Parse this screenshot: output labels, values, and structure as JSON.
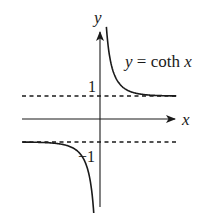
{
  "figure": {
    "title": "y = coth x",
    "curve_label": {
      "lhs": "y",
      "eq": " = coth ",
      "rhs": "x"
    },
    "axes": {
      "x_label": "x",
      "y_label": "y"
    },
    "ticks": {
      "y_pos_one": "1",
      "y_neg_one": "−1"
    },
    "asymptotes": [
      {
        "name": "y = 1",
        "style": "dashed"
      },
      {
        "name": "y = -1",
        "style": "dashed"
      }
    ],
    "colors": {
      "ink": "#1a1a1a",
      "background": "#ffffff"
    }
  },
  "chart_data": {
    "type": "line",
    "title": "y = coth x",
    "xlabel": "x",
    "ylabel": "y",
    "function": "coth(x)",
    "series": [
      {
        "name": "coth x (x>0)",
        "x": [
          0.28,
          0.4,
          0.6,
          0.8,
          1.0,
          1.5,
          2.0,
          2.5,
          3.0
        ],
        "values": [
          3.66,
          2.63,
          1.86,
          1.51,
          1.31,
          1.1,
          1.04,
          1.01,
          1.0
        ]
      },
      {
        "name": "coth x (x<0)",
        "x": [
          -3.1,
          -2.5,
          -2.0,
          -1.5,
          -1.0,
          -0.8,
          -0.6,
          -0.4,
          -0.22
        ],
        "values": [
          -1.0,
          -1.01,
          -1.04,
          -1.1,
          -1.31,
          -1.51,
          -1.86,
          -2.63,
          -4.62
        ]
      }
    ],
    "asymptotes": {
      "horizontal": [
        1,
        -1
      ],
      "vertical": [
        0
      ]
    },
    "y_ticks": [
      "1",
      "-1"
    ],
    "grid": false,
    "legend": "none"
  }
}
